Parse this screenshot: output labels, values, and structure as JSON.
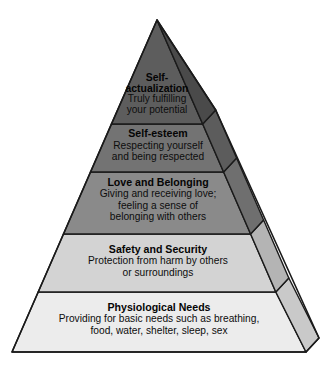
{
  "diagram": {
    "type": "pyramid",
    "name": "hierarchy-of-needs-pyramid",
    "orientation": "apex-top",
    "tier_count": 5,
    "canvas": {
      "width": 326,
      "height": 369,
      "background": "#ffffff"
    },
    "geometry": {
      "apex": {
        "x": 157,
        "y": 20
      },
      "base_left": {
        "x": 12,
        "y": 352
      },
      "base_right": {
        "x": 306,
        "y": 352
      },
      "depth_offset": {
        "dx": 13,
        "dy": -14
      },
      "tier_boundaries_y": [
        124,
        172,
        234,
        292
      ],
      "outline_color": "#1a1a1a",
      "outline_width": 1.4
    },
    "tiers": [
      {
        "index": 1,
        "level": "top",
        "title": "Self-actualization",
        "title_lines": [
          "Self-",
          "actualization"
        ],
        "description": "Truly fulfilling your potential",
        "description_lines": [
          "Truly fulfilling",
          "your potential"
        ],
        "face_color": "#5d5d5d",
        "side_color": "#4a4a4a",
        "text_color": "#050505"
      },
      {
        "index": 2,
        "level": "fourth",
        "title": "Self-esteem",
        "title_lines": [
          "Self-esteem"
        ],
        "description": "Respecting yourself and being respected",
        "description_lines": [
          "Respecting yourself",
          "and being respected"
        ],
        "face_color": "#737373",
        "side_color": "#5c5c5c",
        "text_color": "#050505"
      },
      {
        "index": 3,
        "level": "third",
        "title": "Love and Belonging",
        "title_lines": [
          "Love and Belonging"
        ],
        "description": "Giving and receiving love; feeling a sense of belonging with others",
        "description_lines": [
          "Giving and receiving love;",
          "feeling a sense of",
          "belonging with others"
        ],
        "face_color": "#8a8a8a",
        "side_color": "#6f6f6f",
        "text_color": "#050505"
      },
      {
        "index": 4,
        "level": "second",
        "title": "Safety and Security",
        "title_lines": [
          "Safety and Security"
        ],
        "description": "Protection from harm by others or surroundings",
        "description_lines": [
          "Protection from harm by others",
          "or surroundings"
        ],
        "face_color": "#d3d3d3",
        "side_color": "#b4b4b4",
        "text_color": "#050505"
      },
      {
        "index": 5,
        "level": "base",
        "title": "Physiological Needs",
        "title_lines": [
          "Physiological Needs"
        ],
        "description": "Providing for basic needs such as breathing, food, water, shelter, sleep, sex",
        "description_lines": [
          "Providing for basic needs such as breathing,",
          "food, water, shelter, sleep, sex"
        ],
        "face_color": "#ececec",
        "side_color": "#c9c9c9",
        "text_color": "#050505"
      }
    ]
  }
}
